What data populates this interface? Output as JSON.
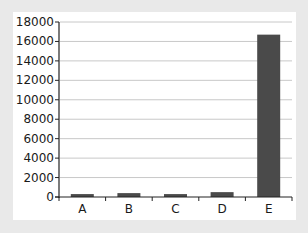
{
  "chart_data": {
    "type": "bar",
    "title": "",
    "xlabel": "",
    "ylabel": "",
    "categories": [
      "A",
      "B",
      "C",
      "D",
      "E"
    ],
    "values": [
      300,
      400,
      300,
      500,
      16700
    ],
    "ylim": [
      0,
      18000
    ],
    "yticks": [
      0,
      2000,
      4000,
      6000,
      8000,
      10000,
      12000,
      14000,
      16000,
      18000
    ],
    "grid": true,
    "legend": null,
    "bar_color": "#4a4a4a",
    "grid_color": "#c8c8c8",
    "background_color": "#e9e9e9",
    "plot_background": "#ffffff"
  }
}
